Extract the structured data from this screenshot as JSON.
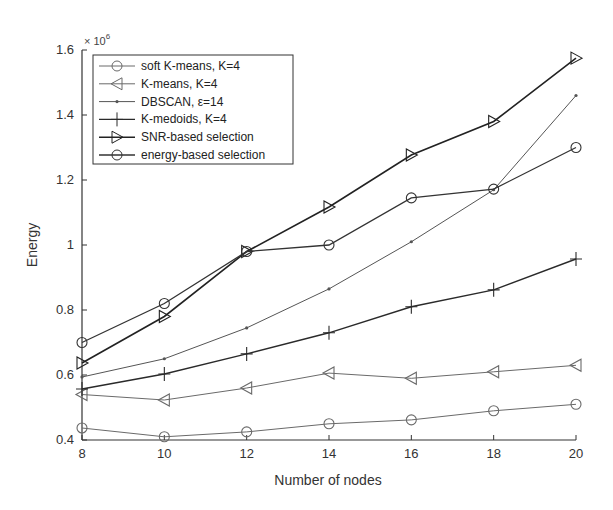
{
  "chart_data": {
    "type": "line",
    "title": "",
    "xlabel": "Number of nodes",
    "ylabel": "Energy",
    "y_multiplier": "× 10^6",
    "y_multiplier_base": "× 10",
    "y_multiplier_exp": "6",
    "x": [
      8,
      10,
      12,
      14,
      16,
      18,
      20
    ],
    "xlim": [
      8,
      20
    ],
    "ylim": [
      0.4,
      1.6
    ],
    "x_ticks": [
      "8",
      "10",
      "12",
      "14",
      "16",
      "18",
      "20"
    ],
    "y_ticks": [
      "0.4",
      "0.6",
      "0.8",
      "1",
      "1.2",
      "1.4",
      "1.6"
    ],
    "grid": false,
    "legend_position": "upper left",
    "series": [
      {
        "name": "soft K-means, K=4",
        "marker": "circle",
        "color": "#6a6a6a",
        "width": 1.0,
        "values": [
          0.437,
          0.41,
          0.425,
          0.45,
          0.462,
          0.49,
          0.51
        ]
      },
      {
        "name": "K-means, K=4",
        "marker": "triangle-left",
        "color": "#6a6a6a",
        "width": 1.0,
        "values": [
          0.54,
          0.523,
          0.56,
          0.606,
          0.59,
          0.61,
          0.63
        ]
      },
      {
        "name": "DBSCAN, ε=14",
        "marker": "point",
        "color": "#555555",
        "width": 1.0,
        "values": [
          0.594,
          0.65,
          0.745,
          0.865,
          1.01,
          1.17,
          1.46
        ]
      },
      {
        "name": "K-medoids, K=4",
        "marker": "plus",
        "color": "#2a2a2a",
        "width": 1.4,
        "values": [
          0.557,
          0.603,
          0.665,
          0.73,
          0.81,
          0.862,
          0.957
        ]
      },
      {
        "name": "SNR-based selection",
        "marker": "triangle-right",
        "color": "#222222",
        "width": 1.6,
        "values": [
          0.637,
          0.78,
          0.98,
          1.117,
          1.277,
          1.38,
          1.575
        ]
      },
      {
        "name": "energy-based selection",
        "marker": "circle",
        "color": "#333333",
        "width": 1.3,
        "values": [
          0.7,
          0.82,
          0.98,
          1.0,
          1.145,
          1.172,
          1.3
        ]
      }
    ]
  }
}
